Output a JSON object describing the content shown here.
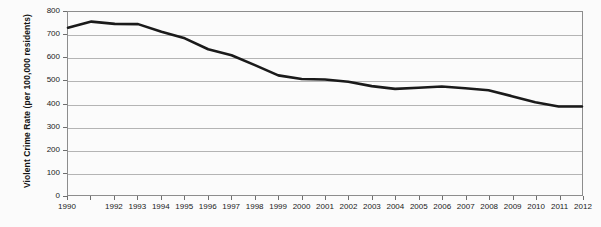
{
  "chart_data": {
    "type": "line",
    "title": "",
    "xlabel": "",
    "ylabel": "Violent Crime Rate (per 100,000 residents)",
    "ylim": [
      0,
      800
    ],
    "ytick_values": [
      800,
      700,
      600,
      500,
      400,
      300,
      200,
      100,
      0
    ],
    "ytick_labels": [
      "800",
      "700",
      "600",
      "500",
      "400",
      "300",
      "200",
      "100",
      "0"
    ],
    "grid": true,
    "legend": "none",
    "line_color": "#1a1a1a",
    "line_width": 2.6,
    "x": [
      1990,
      1991,
      1992,
      1993,
      1994,
      1995,
      1996,
      1997,
      1998,
      1999,
      2000,
      2001,
      2002,
      2003,
      2004,
      2005,
      2006,
      2007,
      2008,
      2009,
      2010,
      2011,
      2012
    ],
    "xtick_labels": [
      "1990",
      "",
      "1992",
      "1993",
      "1994",
      "1995",
      "1996",
      "1997",
      "1998",
      "1999",
      "2000",
      "2001",
      "2002",
      "2003",
      "2004",
      "2005",
      "2006",
      "2007",
      "2008",
      "2009",
      "2010",
      "2011",
      "2012"
    ],
    "values": [
      731,
      758,
      748,
      747,
      714,
      685,
      637,
      611,
      568,
      523,
      507,
      505,
      495,
      476,
      464,
      469,
      474,
      467,
      458,
      432,
      405,
      387,
      387
    ],
    "series": [
      {
        "name": "Violent Crime Rate",
        "values": [
          731,
          758,
          748,
          747,
          714,
          685,
          637,
          611,
          568,
          523,
          507,
          505,
          495,
          476,
          464,
          469,
          474,
          467,
          458,
          432,
          405,
          387,
          387
        ]
      }
    ]
  }
}
